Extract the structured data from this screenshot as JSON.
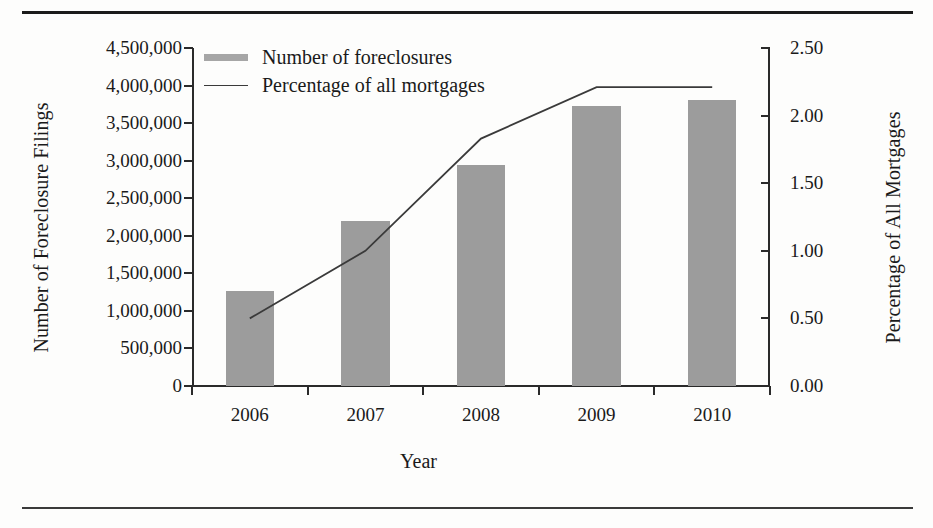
{
  "chart_data": {
    "type": "bar",
    "title": "",
    "xlabel": "Year",
    "categories": [
      "2006",
      "2007",
      "2008",
      "2009",
      "2010"
    ],
    "grid": false,
    "legend_position": "top-left",
    "axes": {
      "left": {
        "label": "Number of Foreclosure Filings",
        "ylim": [
          0,
          4500000
        ],
        "tick_values": [
          0,
          500000,
          1000000,
          1500000,
          2000000,
          2500000,
          3000000,
          3500000,
          4000000,
          4500000
        ],
        "tick_labels": [
          "0",
          "500,000",
          "1,000,000",
          "1,500,000",
          "2,000,000",
          "2,500,000",
          "3,000,000",
          "3,500,000",
          "4,000,000",
          "4,500,000"
        ]
      },
      "right": {
        "label": "Percentage of All Mortgages",
        "ylim": [
          0,
          2.5
        ],
        "tick_values": [
          0,
          0.5,
          1.0,
          1.5,
          2.0,
          2.5
        ],
        "tick_labels": [
          "0.00",
          "0.50",
          "1.00",
          "1.50",
          "2.00",
          "2.50"
        ]
      }
    },
    "series": [
      {
        "name": "Number of foreclosures",
        "type": "bar",
        "axis": "left",
        "color": "#9c9c9c",
        "values": [
          1260000,
          2200000,
          2940000,
          3730000,
          3810000
        ]
      },
      {
        "name": "Percentage of all mortgages",
        "type": "line",
        "axis": "right",
        "color": "#3a3a3a",
        "values": [
          0.5,
          1.0,
          1.83,
          2.21,
          2.21
        ]
      }
    ]
  },
  "legend": {
    "items": [
      {
        "label": "Number of foreclosures",
        "marker": "bar-swatch"
      },
      {
        "label": "Percentage of all mortgages",
        "marker": "line-swatch"
      }
    ]
  }
}
